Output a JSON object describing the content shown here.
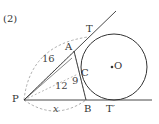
{
  "problem_label": "(2)",
  "points": {
    "P": {
      "label": "P",
      "x": 24,
      "y": 100
    },
    "A": {
      "label": "A",
      "x": 74,
      "y": 51
    },
    "T": {
      "label": "T",
      "x": 88,
      "y": 37
    },
    "C": {
      "label": "C",
      "x": 80,
      "y": 72
    },
    "B": {
      "label": "B",
      "x": 86,
      "y": 100
    },
    "T_prime": {
      "label": "T′",
      "x": 114,
      "y": 100
    },
    "O": {
      "label": "O",
      "x": 114,
      "y": 67
    }
  },
  "circle": {
    "center_label": "O",
    "cx": 114,
    "cy": 67,
    "r": 33
  },
  "segment_labels": {
    "PA_arc": "16",
    "PC": "12",
    "AC_BC": "9",
    "PB": "x"
  },
  "colors": {
    "line": "#333333",
    "dashed": "#888888",
    "text": "#333333"
  }
}
